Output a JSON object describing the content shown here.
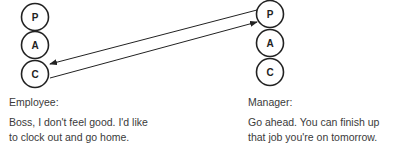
{
  "employee": {
    "states": [
      "P",
      "A",
      "C"
    ],
    "label": "Employee:",
    "line1": "Boss, I don't feel good. I'd like",
    "line2": "to clock out and go home."
  },
  "manager": {
    "states": [
      "P",
      "A",
      "C"
    ],
    "label": "Manager:",
    "line1": "Go ahead. You can finish up",
    "line2": "that job you're on tomorrow."
  },
  "transactions": [
    {
      "from": "employee.C",
      "to": "manager.P"
    },
    {
      "from": "manager.P",
      "to": "employee.C"
    }
  ]
}
